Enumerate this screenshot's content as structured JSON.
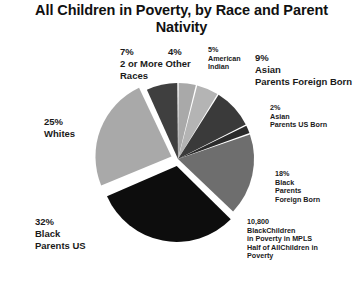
{
  "chart_data": {
    "type": "pie",
    "title": "All Children in Poverty, by Race and Parent Nativity",
    "xlabel": "",
    "ylabel": "",
    "legend": "none",
    "grid": false,
    "categories": [
      "4%",
      "American Indian",
      "Asian Parents Foreign Born",
      "Asian Parents US Born",
      "Black Parents Foreign Born",
      "Black Parents US",
      "Whites",
      "2 or More Other Races"
    ],
    "values": [
      4,
      5,
      9,
      2,
      18,
      32,
      25,
      7
    ],
    "labels": [
      "4%",
      "5% American Indian",
      "9% Asian Parents Foreign Born",
      "2% Asian Parents US Born",
      "18% Black Parents Foreign Born",
      "32% Black Parents US",
      "25% Whites",
      "7% 2 or More Other Races"
    ],
    "colors": [
      "#a9a9a9",
      "#b4b4b4",
      "#3a3a3a",
      "#2b2b2b",
      "#6e6e6e",
      "#0d0d0d",
      "#a9a9a9",
      "#3f3f3f"
    ],
    "exploded": [
      "Black Parents US",
      "Whites"
    ],
    "annotation": "10,800 BlackChildren in Poverty in MPLS Half of AllChildren in Poverty"
  },
  "title": {
    "line1": "All Children in Poverty, by Race and Parent",
    "line2": "Nativity",
    "full": "All Children in Poverty, by Race and Parent Nativity"
  },
  "labels": {
    "two_or_more": "7%\n2 or More Other\nRaces",
    "four_pct": "4%",
    "american_indian": "5%\nAmerican\nIndian",
    "asian_foreign": "9%\nAsian\nParents Foreign Born",
    "asian_us": "2%\nAsian\nParents US Born",
    "black_foreign": "18%\nBlack\nParents\nForeign Born",
    "mpls_note": "10,800\nBlackChildren\nin Poverty in MPLS\nHalf of AllChildren in\nPoverty",
    "whites": "25%\nWhites",
    "black_us": "32%\nBlack\nParents US"
  },
  "colors": {
    "background": "#ffffff",
    "text": "#1a1a1a",
    "slice_light": "#a9a9a9",
    "slice_light2": "#b4b4b4",
    "slice_mid": "#6e6e6e",
    "slice_dark": "#3a3a3a",
    "slice_darker": "#2b2b2b",
    "slice_black": "#0d0d0d",
    "slice_gray": "#3f3f3f"
  }
}
